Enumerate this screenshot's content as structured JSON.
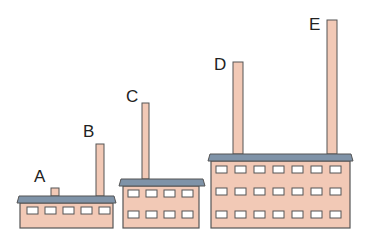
{
  "diagram": {
    "colors": {
      "wall": "#f2c9b6",
      "roof": "#7f93a8",
      "outline": "#555555",
      "window": "#ffffff",
      "chimney": "#f2c9b6",
      "text": "#222222"
    },
    "labels": [
      {
        "id": "A",
        "text": "A",
        "x": 34,
        "y": 182
      },
      {
        "id": "B",
        "text": "B",
        "x": 83,
        "y": 137
      },
      {
        "id": "C",
        "text": "C",
        "x": 126,
        "y": 102
      },
      {
        "id": "D",
        "text": "D",
        "x": 214,
        "y": 70
      },
      {
        "id": "E",
        "text": "E",
        "x": 309,
        "y": 30
      }
    ],
    "buildings": [
      {
        "name": "small-factory",
        "roof": {
          "x": 17,
          "y": 196,
          "w": 99,
          "h": 7
        },
        "body": {
          "x": 20,
          "y": 203,
          "w": 93,
          "h": 25
        },
        "window_rows": [
          207
        ],
        "window_cols": [
          27,
          45,
          63,
          81,
          99
        ],
        "window_w": 11,
        "window_h": 7
      },
      {
        "name": "medium-factory",
        "roof": {
          "x": 119,
          "y": 179,
          "w": 86,
          "h": 7
        },
        "body": {
          "x": 123,
          "y": 186,
          "w": 76,
          "h": 42
        },
        "window_rows": [
          190,
          211
        ],
        "window_cols": [
          128,
          146,
          164,
          182
        ],
        "window_w": 11,
        "window_h": 7
      },
      {
        "name": "large-factory",
        "roof": {
          "x": 208,
          "y": 154,
          "w": 145,
          "h": 7
        },
        "body": {
          "x": 211,
          "y": 161,
          "w": 139,
          "h": 67
        },
        "window_rows": [
          166,
          188,
          211
        ],
        "window_cols": [
          216,
          235,
          254,
          273,
          292,
          311,
          330
        ],
        "window_w": 11,
        "window_h": 7
      }
    ],
    "chimneys": [
      {
        "id": "A",
        "x": 51,
        "y": 188,
        "w": 8,
        "h": 8
      },
      {
        "id": "B",
        "x": 96,
        "y": 144,
        "w": 8,
        "h": 52
      },
      {
        "id": "C",
        "x": 142,
        "y": 103,
        "w": 7,
        "h": 76
      },
      {
        "id": "D",
        "x": 233,
        "y": 62,
        "w": 10,
        "h": 92
      },
      {
        "id": "E",
        "x": 327,
        "y": 20,
        "w": 10,
        "h": 134
      }
    ]
  }
}
